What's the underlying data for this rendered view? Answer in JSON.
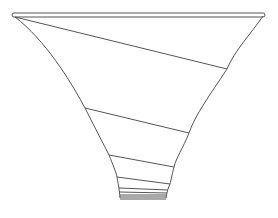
{
  "diagram": {
    "type": "funnel-line-drawing",
    "stroke_color": "#555555",
    "background": "#ffffff",
    "rim": {
      "x1": 13,
      "y1": 15,
      "x2": 264,
      "y2": 15
    },
    "outline": {
      "left": "M15,17 C45,40 70,80 85,108 C96,130 104,145 109,155 C113,165 116,172 117,177 C118,183 119,187 120,198",
      "right": "M263,16 C250,35 235,50 227,69 C210,95 195,115 189,133 C183,148 176,158 174,167 C172,175 171,180 170,184 C168,188 167,192 166,198"
    },
    "segments": [
      {
        "x1": 15,
        "y1": 17,
        "x2": 227,
        "y2": 69
      },
      {
        "x1": 85,
        "y1": 108,
        "x2": 189,
        "y2": 133
      },
      {
        "x1": 109,
        "y1": 155,
        "x2": 174,
        "y2": 167
      },
      {
        "x1": 117,
        "y1": 177,
        "x2": 170,
        "y2": 184
      },
      {
        "x1": 119,
        "y1": 188,
        "x2": 168,
        "y2": 190
      },
      {
        "x1": 119,
        "y1": 192,
        "x2": 167,
        "y2": 193
      },
      {
        "x1": 120,
        "y1": 195,
        "x2": 166,
        "y2": 195
      },
      {
        "x1": 120,
        "y1": 197,
        "x2": 166,
        "y2": 197
      },
      {
        "x1": 120,
        "y1": 199,
        "x2": 166,
        "y2": 199
      }
    ]
  }
}
